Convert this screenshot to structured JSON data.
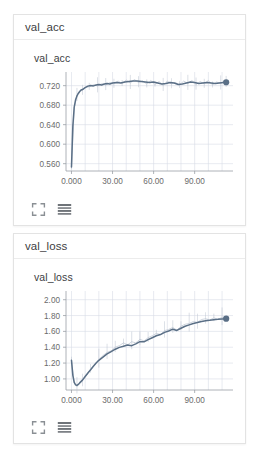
{
  "theme": {
    "bg": "#ffffff",
    "card_border": "#e3e3e3",
    "header_border": "#ececec",
    "text": "#3c4043",
    "tick_text": "#6b6b6b",
    "grid": "#d6dbe6",
    "axis": "#9aa0a6",
    "line": "#5a6f86",
    "line_raw": "#b9c2cf",
    "marker": "#5a6f86"
  },
  "icons": {
    "expand": "expand-icon",
    "data_table": "data-table-icon"
  },
  "cards": [
    {
      "id": "val_acc",
      "header_tag": "val_acc",
      "chart_title": "val_acc",
      "expand_label": "Expand chart",
      "table_label": "Show data table"
    },
    {
      "id": "val_loss",
      "header_tag": "val_loss",
      "chart_title": "val_loss",
      "expand_label": "Expand chart",
      "table_label": "Show data table"
    }
  ],
  "chart_data": [
    {
      "type": "line",
      "id": "val_acc",
      "title": "val_acc",
      "xlabel": "",
      "ylabel": "",
      "grid": true,
      "legend": "none",
      "xlim": [
        -4,
        118
      ],
      "ylim": [
        0.545,
        0.748
      ],
      "xticks": [
        0,
        30,
        60,
        90
      ],
      "xticklabels": [
        "0.000",
        "30.00",
        "60.00",
        "90.00"
      ],
      "yticks": [
        0.56,
        0.6,
        0.64,
        0.68,
        0.72
      ],
      "yticklabels": [
        "0.560",
        "0.600",
        "0.640",
        "0.680",
        "0.720"
      ],
      "series": [
        {
          "name": "val_acc",
          "smoothed": true,
          "x": [
            0,
            1,
            2,
            3,
            4,
            5,
            6,
            7,
            8,
            9,
            10,
            12,
            14,
            16,
            18,
            20,
            22,
            24,
            26,
            28,
            30,
            33,
            36,
            39,
            42,
            45,
            48,
            51,
            54,
            57,
            60,
            63,
            66,
            69,
            72,
            75,
            78,
            81,
            84,
            87,
            90,
            93,
            96,
            99,
            102,
            105,
            108,
            111,
            113
          ],
          "y": [
            0.553,
            0.637,
            0.676,
            0.691,
            0.699,
            0.704,
            0.708,
            0.711,
            0.712,
            0.714,
            0.716,
            0.719,
            0.7205,
            0.7195,
            0.7215,
            0.7225,
            0.7215,
            0.7235,
            0.7245,
            0.7235,
            0.7255,
            0.7265,
            0.7255,
            0.7275,
            0.7285,
            0.7295,
            0.7295,
            0.7285,
            0.7275,
            0.7265,
            0.7275,
            0.7255,
            0.7235,
            0.7245,
            0.7265,
            0.7255,
            0.7225,
            0.7235,
            0.7255,
            0.7275,
            0.7265,
            0.7245,
            0.7255,
            0.7265,
            0.7255,
            0.7245,
            0.7255,
            0.7265,
            0.727
          ]
        },
        {
          "name": "val_acc_raw",
          "smoothed": false,
          "x": [
            0,
            2,
            4,
            6,
            8,
            10,
            13,
            16,
            19,
            22,
            25,
            28,
            31,
            34,
            37,
            40,
            43,
            46,
            49,
            52,
            55,
            58,
            61,
            64,
            67,
            70,
            73,
            76,
            79,
            82,
            85,
            88,
            91,
            94,
            97,
            100,
            103,
            106,
            109,
            112,
            113
          ],
          "y": [
            0.553,
            0.674,
            0.7,
            0.709,
            0.71,
            0.717,
            0.7175,
            0.722,
            0.7195,
            0.724,
            0.7215,
            0.7265,
            0.7235,
            0.7295,
            0.7245,
            0.7315,
            0.7255,
            0.7325,
            0.7265,
            0.7295,
            0.7235,
            0.7305,
            0.7225,
            0.7285,
            0.7205,
            0.7295,
            0.7235,
            0.7265,
            0.7215,
            0.7295,
            0.7245,
            0.7305,
            0.7225,
            0.7285,
            0.7235,
            0.7305,
            0.7215,
            0.7275,
            0.7245,
            0.7295,
            0.727
          ]
        }
      ],
      "endpoint": {
        "x": 113,
        "y": 0.727
      }
    },
    {
      "type": "line",
      "id": "val_loss",
      "title": "val_loss",
      "xlabel": "",
      "ylabel": "",
      "grid": true,
      "legend": "none",
      "xlim": [
        -4,
        118
      ],
      "ylim": [
        0.86,
        2.11
      ],
      "xticks": [
        0,
        30,
        60,
        90
      ],
      "xticklabels": [
        "0.000",
        "30.00",
        "60.00",
        "90.00"
      ],
      "yticks": [
        1.0,
        1.2,
        1.4,
        1.6,
        1.8,
        2.0
      ],
      "yticklabels": [
        "1.00",
        "1.20",
        "1.40",
        "1.60",
        "1.80",
        "2.00"
      ],
      "series": [
        {
          "name": "val_loss",
          "smoothed": true,
          "x": [
            0,
            1,
            2,
            3,
            4,
            5,
            6,
            8,
            10,
            12,
            14,
            16,
            18,
            20,
            23,
            26,
            29,
            32,
            35,
            38,
            41,
            44,
            47,
            50,
            53,
            56,
            59,
            62,
            65,
            68,
            71,
            74,
            77,
            80,
            83,
            86,
            89,
            92,
            95,
            98,
            101,
            104,
            107,
            110,
            113
          ],
          "y": [
            1.235,
            1.045,
            0.955,
            0.925,
            0.918,
            0.93,
            0.95,
            0.985,
            1.03,
            1.075,
            1.115,
            1.16,
            1.2,
            1.235,
            1.275,
            1.315,
            1.345,
            1.375,
            1.398,
            1.412,
            1.428,
            1.42,
            1.442,
            1.47,
            1.468,
            1.496,
            1.52,
            1.545,
            1.56,
            1.588,
            1.605,
            1.628,
            1.612,
            1.64,
            1.665,
            1.682,
            1.7,
            1.712,
            1.726,
            1.735,
            1.74,
            1.748,
            1.752,
            1.758,
            1.76
          ]
        },
        {
          "name": "val_loss_raw",
          "smoothed": false,
          "x": [
            0,
            2,
            4,
            6,
            8,
            11,
            14,
            17,
            20,
            23,
            26,
            29,
            32,
            35,
            38,
            41,
            44,
            47,
            50,
            53,
            56,
            59,
            62,
            65,
            68,
            71,
            74,
            77,
            80,
            83,
            86,
            89,
            92,
            95,
            98,
            101,
            104,
            107,
            110,
            113
          ],
          "y": [
            1.235,
            0.95,
            0.905,
            0.945,
            0.975,
            1.045,
            1.125,
            1.175,
            1.245,
            1.295,
            1.335,
            1.355,
            1.4,
            1.42,
            1.455,
            1.43,
            1.47,
            1.455,
            1.5,
            1.48,
            1.52,
            1.545,
            1.575,
            1.56,
            1.61,
            1.625,
            1.65,
            1.615,
            1.665,
            1.69,
            1.7,
            1.725,
            1.715,
            1.75,
            1.76,
            1.745,
            1.77,
            1.755,
            1.775,
            1.76
          ]
        }
      ],
      "endpoint": {
        "x": 113,
        "y": 1.76
      }
    }
  ]
}
